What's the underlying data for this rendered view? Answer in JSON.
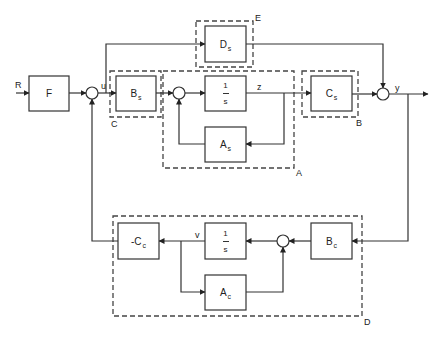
{
  "diagram": {
    "type": "block-diagram",
    "signals": {
      "reference": "R",
      "control": "u",
      "state_plant": "z",
      "output": "y",
      "state_controller": "v"
    },
    "blocks": {
      "F": {
        "main": "F",
        "sub": ""
      },
      "Bs": {
        "main": "B",
        "sub": "s"
      },
      "integrator_plant": {
        "num": "1",
        "den": "s"
      },
      "As": {
        "main": "A",
        "sub": "s"
      },
      "Ds": {
        "main": "D",
        "sub": "s"
      },
      "Cs": {
        "main": "C",
        "sub": "s"
      },
      "negCc": {
        "main": "-C",
        "sub": "c"
      },
      "integrator_controller": {
        "num": "1",
        "den": "s"
      },
      "Ac": {
        "main": "A",
        "sub": "c"
      },
      "Bc": {
        "main": "B",
        "sub": "c"
      }
    },
    "groups": {
      "A": "A",
      "B": "B",
      "C": "C",
      "D": "D",
      "E": "E"
    },
    "summing_junctions": 4
  }
}
